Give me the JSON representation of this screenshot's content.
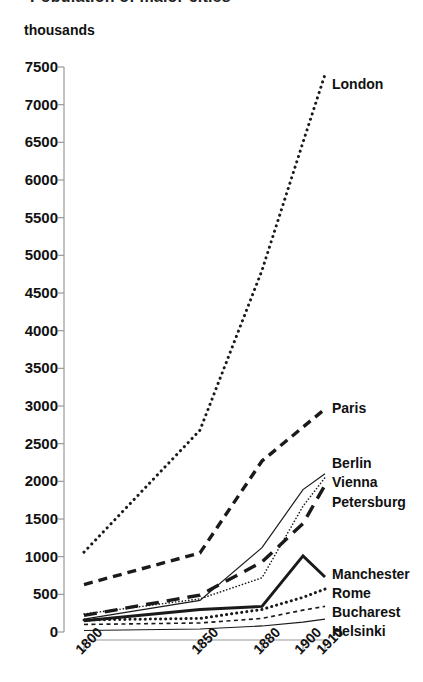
{
  "title": "Population of major cities",
  "title_clipped": true,
  "axis_unit_label": "thousands",
  "colors": {
    "ink": "#111111",
    "line": "#1a1a1a",
    "axis": "#999999",
    "background": "#ffffff"
  },
  "axis": {
    "y_ticks": [
      0,
      500,
      1000,
      1500,
      2000,
      2500,
      3000,
      3500,
      4000,
      4500,
      5000,
      5500,
      6000,
      6500,
      7000,
      7500
    ],
    "x_ticks": [
      "1800",
      "1850",
      "1880",
      "1900",
      "1910"
    ]
  },
  "chart_data": {
    "type": "line",
    "title": "Population of major cities",
    "xlabel": "",
    "ylabel": "thousands",
    "ylim": [
      0,
      7500
    ],
    "grid": false,
    "legend": "right-inline-labels",
    "x": [
      1800,
      1850,
      1880,
      1900,
      1910
    ],
    "xtick_labels": [
      "1800",
      "1850",
      "1880",
      "1900",
      "1910"
    ],
    "ytick_labels": [
      "0",
      "500",
      "1000",
      "1500",
      "2000",
      "2500",
      "3000",
      "3500",
      "4000",
      "4500",
      "5000",
      "5500",
      "6000",
      "6500",
      "7000",
      "7500"
    ],
    "series": [
      {
        "name": "London",
        "style": "dotted",
        "width": 3.0,
        "values": [
          1060,
          2680,
          4800,
          6500,
          7400
        ]
      },
      {
        "name": "Paris",
        "style": "dashed",
        "width": 3.4,
        "values": [
          630,
          1050,
          2270,
          2720,
          2960
        ]
      },
      {
        "name": "Berlin",
        "style": "solid-thin",
        "width": 1.2,
        "values": [
          170,
          420,
          1120,
          1890,
          2100
        ]
      },
      {
        "name": "Vienna",
        "style": "fine-dotted",
        "width": 1.6,
        "values": [
          240,
          440,
          720,
          1670,
          2050
        ]
      },
      {
        "name": "Petersburg",
        "style": "long-dashed",
        "width": 3.4,
        "values": [
          220,
          490,
          930,
          1440,
          1950
        ]
      },
      {
        "name": "Manchester",
        "style": "solid-thick",
        "width": 3.0,
        "values": [
          150,
          300,
          340,
          1010,
          730
        ]
      },
      {
        "name": "Rome",
        "style": "thick-dotted",
        "width": 3.0,
        "values": [
          160,
          180,
          300,
          460,
          570
        ]
      },
      {
        "name": "Bucharest",
        "style": "short-dashed",
        "width": 1.6,
        "values": [
          100,
          120,
          180,
          290,
          340
        ]
      },
      {
        "name": "Helsinki",
        "style": "hairline",
        "width": 1.2,
        "values": [
          20,
          40,
          80,
          130,
          170
        ]
      }
    ]
  },
  "series_labels": [
    {
      "name": "London",
      "x": 332,
      "y": 76
    },
    {
      "name": "Paris",
      "x": 332,
      "y": 400
    },
    {
      "name": "Berlin",
      "x": 332,
      "y": 455
    },
    {
      "name": "Vienna",
      "x": 332,
      "y": 474
    },
    {
      "name": "Petersburg",
      "x": 332,
      "y": 494
    },
    {
      "name": "Manchester",
      "x": 332,
      "y": 566
    },
    {
      "name": "Rome",
      "x": 332,
      "y": 585
    },
    {
      "name": "Bucharest",
      "x": 332,
      "y": 604
    },
    {
      "name": "Helsinki",
      "x": 332,
      "y": 623
    }
  ]
}
